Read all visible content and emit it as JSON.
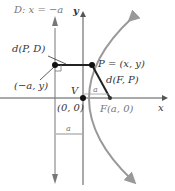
{
  "diagram": {
    "type": "parabola-definition",
    "labels": {
      "directrix": "D: x = −a",
      "y_axis": "y",
      "x_axis": "x",
      "dist_pd": "d(P, D)",
      "point_p": "P = (x, y)",
      "dist_fp": "d(F, P)",
      "foot_point": "(−a, y)",
      "vertex": "V",
      "origin": "(0, 0)",
      "focus": "F(a, 0)",
      "a_top": "a",
      "a_bottom": "a"
    },
    "colors": {
      "axis": "#555555",
      "curve": "#999999",
      "segment": "#222222",
      "point": "#111111",
      "text": "#333333"
    }
  }
}
